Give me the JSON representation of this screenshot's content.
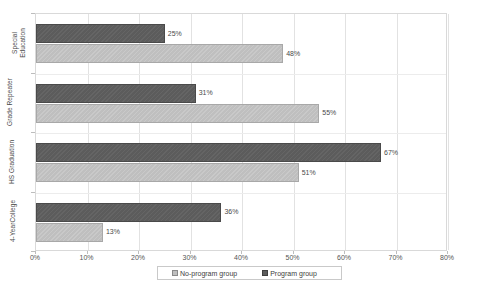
{
  "chart_data": {
    "type": "bar",
    "orientation": "horizontal",
    "title": "",
    "xlabel": "",
    "ylabel": "",
    "xlim": [
      0,
      80
    ],
    "x_tick_labels": [
      "0%",
      "10%",
      "20%",
      "30%",
      "40%",
      "50%",
      "60%",
      "70%",
      "80%"
    ],
    "x_tick_values": [
      0,
      10,
      20,
      30,
      40,
      50,
      60,
      70,
      80
    ],
    "grid": true,
    "legend_position": "bottom",
    "categories": [
      "Special Education",
      "Grade Repeater",
      "HS Graduation",
      "4-YearCollege"
    ],
    "category_label_lines": [
      [
        "Special",
        "Education"
      ],
      [
        "Grade Repeater"
      ],
      [
        "HS Graduation"
      ],
      [
        "4-YearCollege"
      ]
    ],
    "series": [
      {
        "name": "No-program group",
        "color": "#bfbfbf",
        "values": [
          48,
          55,
          51,
          13
        ],
        "value_labels": [
          "48%",
          "55%",
          "51%",
          "13%"
        ]
      },
      {
        "name": "Program group",
        "color": "#5c5c5c",
        "values": [
          25,
          31,
          67,
          36
        ],
        "value_labels": [
          "25%",
          "31%",
          "67%",
          "36%"
        ]
      }
    ]
  },
  "legend": {
    "entries": [
      {
        "label": "No-program group",
        "swatch": "light"
      },
      {
        "label": "Program group",
        "swatch": "dark"
      }
    ]
  }
}
